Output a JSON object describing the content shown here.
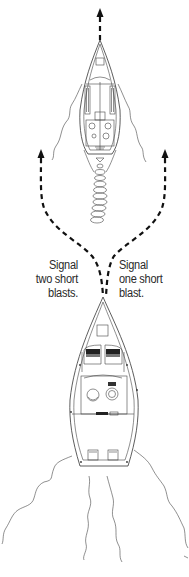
{
  "diagram": {
    "left_label": {
      "lines": [
        "Signal",
        "two short",
        "blasts."
      ]
    },
    "right_label": {
      "lines": [
        "Signal",
        "one short",
        "blast."
      ]
    },
    "elements": {
      "lead_boat": "boat-being-overtaken (top, heading up, with wake)",
      "overtaking_boat": "boat-overtaking (bottom, heading up, with wake)",
      "path_left": "dashed arrow curving to port side",
      "path_right": "dashed arrow curving to starboard side",
      "path_ahead": "dashed arrow ahead of lead boat"
    },
    "colors": {
      "line": "#333333",
      "dash": "#111111",
      "background": "#ffffff"
    }
  }
}
